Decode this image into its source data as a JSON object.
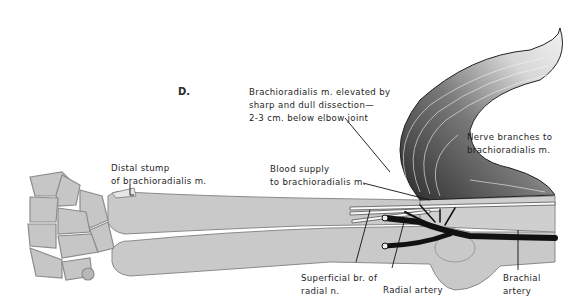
{
  "figure": {
    "panel_letter": "D.",
    "labels": {
      "elevated": {
        "line1": "Brachioradialis m. elevated by",
        "line2": "sharp and dull dissection—",
        "line3": "2-3 cm. below elbow joint"
      },
      "nerve_branches": {
        "line1": "Nerve branches to",
        "line2": "brachioradialis m."
      },
      "distal_stump": {
        "line1": "Distal stump",
        "line2": "of brachioradialis m."
      },
      "blood_supply": {
        "line1": "Blood supply",
        "line2": "to brachioradialis m."
      },
      "superficial_br": {
        "line1": "Superficial br. of",
        "line2": "radial n."
      },
      "radial_artery": {
        "line1": "Radial artery"
      },
      "brachial_artery": {
        "line1": "Brachial",
        "line2": "artery"
      }
    },
    "colors": {
      "bone": "#c9c9c9",
      "bone_outline": "#8a8a8a",
      "artery": "#111111",
      "muscle_dark": "#2a2a2a",
      "muscle_light": "#e8e8e8"
    }
  }
}
